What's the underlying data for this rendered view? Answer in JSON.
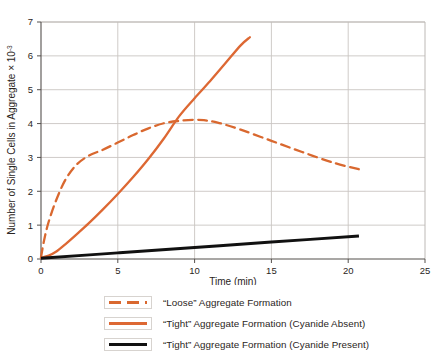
{
  "chart_data": {
    "type": "line",
    "title": "",
    "xlabel": "Time (min)",
    "ylabel_main": "Number of Single Cells in Aggregate × 10",
    "ylabel_exponent": "-3",
    "xlim": [
      0,
      25
    ],
    "ylim": [
      0,
      7
    ],
    "xticks": [
      "0",
      "5",
      "10",
      "15",
      "20",
      "25"
    ],
    "xtick_values": [
      0,
      5,
      10,
      15,
      20,
      25
    ],
    "yticks": [
      "0",
      "1",
      "2",
      "3",
      "4",
      "5",
      "6",
      "7"
    ],
    "ytick_values": [
      0,
      1,
      2,
      3,
      4,
      5,
      6,
      7
    ],
    "grid": true,
    "grid_color": "#c9c5c2",
    "legend_position": "bottom",
    "series": [
      {
        "name": "“Loose” Aggregate Formation",
        "style": "dashed",
        "color": "#d9682f",
        "x": [
          0.0,
          0.2,
          0.5,
          1.0,
          1.6,
          2.3,
          3.1,
          4.0,
          5.0,
          6.0,
          7.0,
          8.0,
          9.0,
          10.0,
          10.6,
          11.5,
          13.0,
          15.0,
          17.0,
          19.0,
          20.7
        ],
        "y": [
          0.05,
          0.55,
          1.1,
          1.75,
          2.35,
          2.78,
          3.05,
          3.22,
          3.44,
          3.66,
          3.86,
          4.01,
          4.08,
          4.11,
          4.1,
          4.03,
          3.82,
          3.49,
          3.16,
          2.85,
          2.65
        ]
      },
      {
        "name": "“Tight” Aggregate Formation (Cyanide Absent)",
        "style": "solid",
        "color": "#dd6833",
        "x": [
          0.0,
          0.5,
          1.0,
          1.6,
          2.3,
          3.1,
          4.0,
          5.0,
          6.0,
          7.0,
          8.0,
          9.0,
          10.0,
          11.0,
          12.0,
          13.0,
          13.6
        ],
        "y": [
          0.04,
          0.1,
          0.22,
          0.44,
          0.72,
          1.05,
          1.45,
          1.92,
          2.42,
          2.96,
          3.56,
          4.22,
          4.75,
          5.25,
          5.78,
          6.31,
          6.55
        ]
      },
      {
        "name": "“Tight” Aggregate Formation (Cyanide Present)",
        "style": "solid-thick",
        "color": "#111111",
        "x": [
          0.0,
          5.0,
          10.0,
          15.0,
          20.7
        ],
        "y": [
          0.02,
          0.18,
          0.34,
          0.5,
          0.68
        ]
      }
    ]
  },
  "legend": {
    "items": [
      {
        "label": "“Loose” Aggregate Formation",
        "style": "dashed",
        "color": "#d9682f"
      },
      {
        "label": "“Tight” Aggregate Formation (Cyanide Absent)",
        "style": "solid",
        "color": "#dd6833"
      },
      {
        "label": "“Tight” Aggregate Formation (Cyanide Present)",
        "style": "solid-thick",
        "color": "#111111"
      }
    ]
  }
}
